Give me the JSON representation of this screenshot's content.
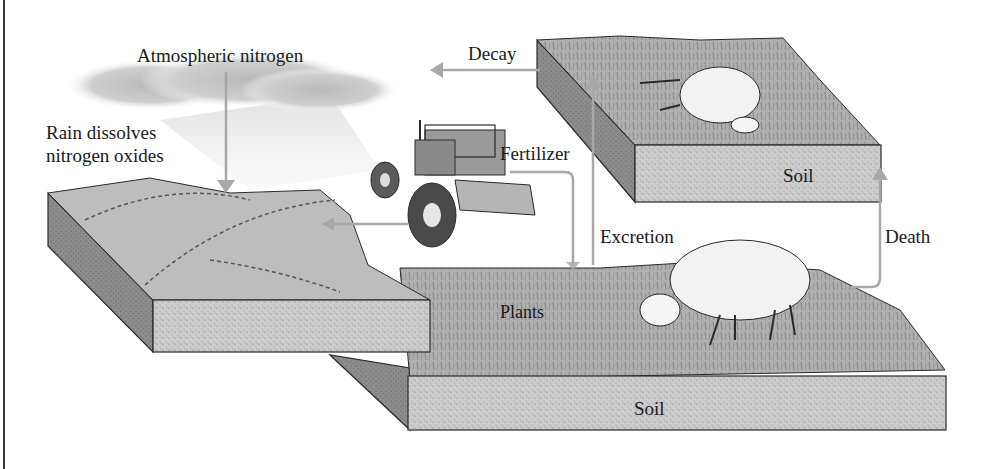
{
  "diagram": {
    "topic": "nitrogen-cycle",
    "labels": {
      "atmospheric_nitrogen": "Atmospheric nitrogen",
      "rain_line1": "Rain dissolves",
      "rain_line2": "nitrogen oxides",
      "decay": "Decay",
      "fertilizer": "Fertilizer",
      "excretion": "Excretion",
      "death": "Death",
      "plants": "Plants",
      "soil_top": "Soil",
      "soil_bottom": "Soil"
    },
    "colors": {
      "arrow": "#a8a8a8",
      "soil_face": "#cfcfcf",
      "soil_side": "#8a8a8a",
      "grass_top": "#a9a9a9",
      "hill_top": "#bdbdbd",
      "cloud": "#c4c4c4",
      "outline": "#2a2a2a"
    },
    "elements": [
      {
        "name": "cloud",
        "description": "rain cloud with rain streaks"
      },
      {
        "name": "hill-soil-block",
        "description": "left block with hills and shrubs"
      },
      {
        "name": "tractor",
        "description": "tractor spreading fertilizer"
      },
      {
        "name": "dead-sheep-soil-block",
        "description": "upper right block with dead sheep"
      },
      {
        "name": "grazing-sheep",
        "description": "sheep grazing on grassland"
      },
      {
        "name": "grassland-soil-block",
        "description": "lower central block with plants"
      }
    ],
    "arrows": [
      {
        "from": "cloud",
        "to": "hill-soil-block",
        "label": "Atmospheric nitrogen"
      },
      {
        "from": "dead-sheep-soil-block",
        "to": "left",
        "label": "Decay"
      },
      {
        "from": "tractor",
        "to": "grassland-soil-block",
        "label": "Fertilizer"
      },
      {
        "from": "tractor",
        "to": "hill-soil-block",
        "label": ""
      },
      {
        "from": "grassland-soil-block",
        "to": "dead-sheep-soil-block",
        "label": "Excretion"
      },
      {
        "from": "grazing-sheep",
        "to": "dead-sheep-soil-block",
        "label": "Death"
      }
    ]
  }
}
